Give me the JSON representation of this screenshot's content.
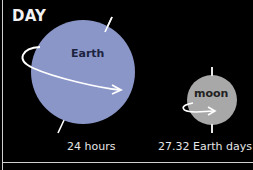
{
  "title": "DAY",
  "bodies": [
    {
      "name": "Earth",
      "rotation_period": "24 hours",
      "color": "#8a96c8"
    },
    {
      "name": "moon",
      "rotation_period": "27.32 Earth days",
      "color": "#a8a8a8"
    }
  ],
  "colors": {
    "background": "#000000",
    "lines": "#ffffff",
    "border": "#cfcfcf"
  }
}
